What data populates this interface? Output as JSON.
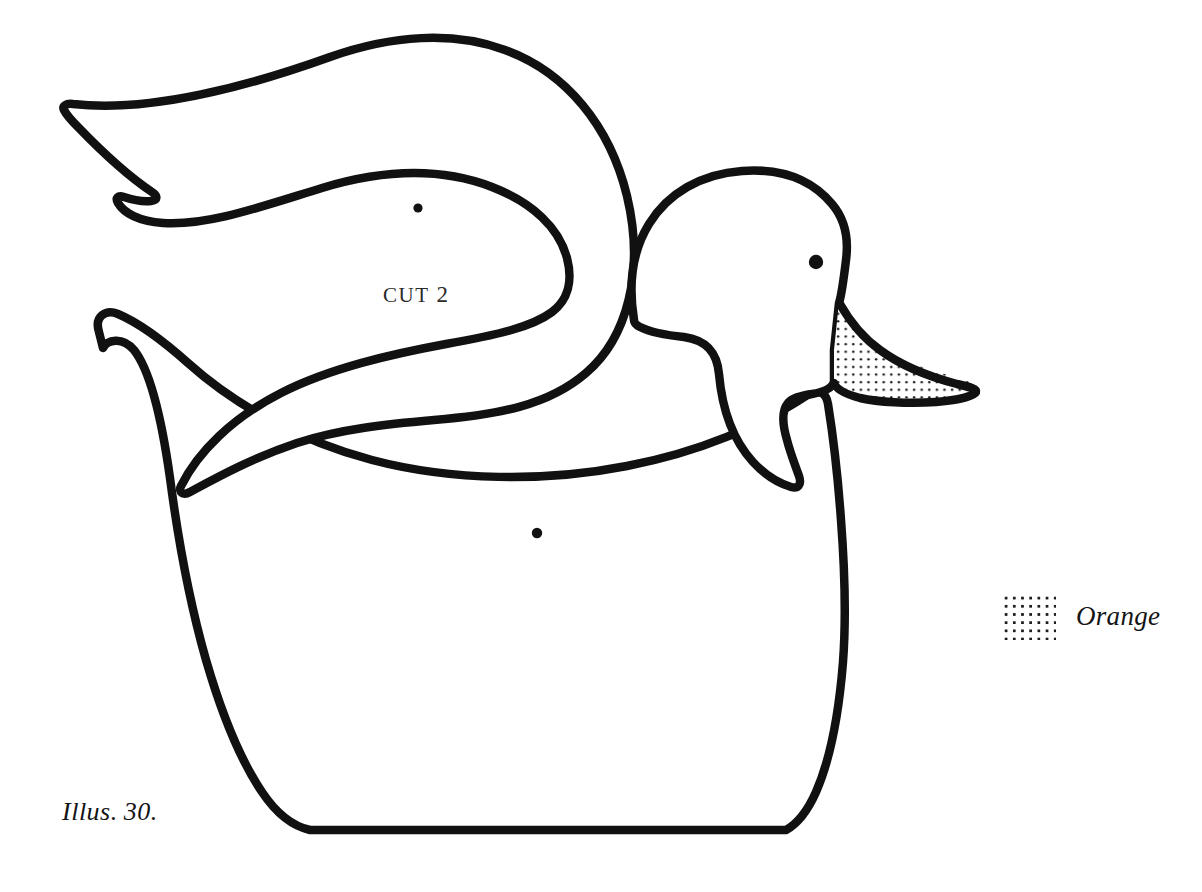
{
  "document": {
    "title": "Duck Pattern Illustration",
    "background_color": "#ffffff",
    "ink_color": "#111111",
    "width": 1202,
    "height": 892
  },
  "figure": {
    "caption": "Illus.",
    "caption_number": "30.",
    "parts": [
      {
        "name": "body",
        "label": "",
        "pivot_dot": {
          "x": 537,
          "y": 533,
          "r": 5.2
        },
        "outline_color": "#111111",
        "fill_color": "#ffffff"
      },
      {
        "name": "wing",
        "label": "CUT 2",
        "label_word": "CUT",
        "label_number": "2",
        "pivot_dot": {
          "x": 418,
          "y": 208,
          "r": 4.6
        },
        "outline_color": "#111111",
        "fill_color": "#ffffff"
      },
      {
        "name": "beak",
        "label": "",
        "pattern": "dotted",
        "pattern_meaning": "Orange",
        "outline_color": "#111111",
        "fill_color": "#ffffff"
      },
      {
        "name": "eye",
        "dot": {
          "x": 816,
          "y": 262,
          "r": 7.2
        },
        "fill_color": "#111111"
      }
    ]
  },
  "legend": {
    "swatch_pattern": "dotted",
    "swatch_dot_color": "#1d1d1d",
    "swatch_background": "#ffffff",
    "label": "Orange"
  }
}
